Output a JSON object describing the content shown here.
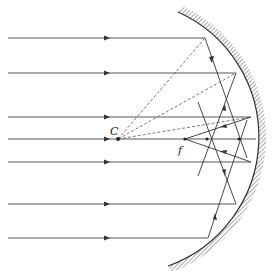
{
  "labels": {
    "center": "C",
    "focus": "f"
  },
  "colors": {
    "ray": "#333333",
    "dashed": "#555555",
    "mirror": "#333333",
    "hatch": "#444444",
    "background": "#ffffff"
  },
  "geometry": {
    "center_of_curvature": [
      118,
      139
    ],
    "paraxial_focus": [
      185,
      139
    ],
    "mirror_radius": 137,
    "incident_ray_heights": [
      38,
      73,
      117,
      139,
      162,
      204,
      238
    ],
    "mirror_hit_points": [
      [
        205,
        38
      ],
      [
        236,
        73
      ],
      [
        251,
        117
      ],
      [
        256,
        139
      ],
      [
        251,
        162
      ],
      [
        236,
        204
      ],
      [
        208,
        238
      ]
    ],
    "axis_crossings": [
      [
        207,
        139
      ],
      [
        239,
        139
      ]
    ]
  }
}
